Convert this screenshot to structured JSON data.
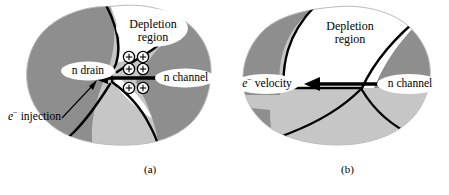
{
  "figure": {
    "colors": {
      "dark_gray": "#8e8e8e",
      "light_gray": "#c6c6c6",
      "white": "#ffffff",
      "outline": "#000000",
      "background": "#ffffff"
    },
    "panels": [
      {
        "id": "a",
        "caption": "(a)",
        "labels": {
          "depletion_region_line1": "Depletion",
          "depletion_region_line2": "region",
          "n_drain": "n drain",
          "n_channel": "n channel",
          "e_injection_symbol": "e",
          "e_injection_superscript": "−",
          "e_injection_text": "injection"
        },
        "charge_symbols": {
          "glyph": "+",
          "count": 6,
          "meaning": "positive-ion-charges",
          "rows": 3,
          "columns": 2
        },
        "arrow": {
          "direction": "left",
          "meaning": "electron-injection-direction"
        }
      },
      {
        "id": "b",
        "caption": "(b)",
        "labels": {
          "depletion_region_line1": "Depletion",
          "depletion_region_line2": "region",
          "n_channel": "n channel",
          "e_velocity_symbol": "e",
          "e_velocity_superscript": "−",
          "e_velocity_text": "velocity"
        },
        "arrow": {
          "direction": "left",
          "meaning": "electron-velocity-direction"
        }
      }
    ]
  }
}
